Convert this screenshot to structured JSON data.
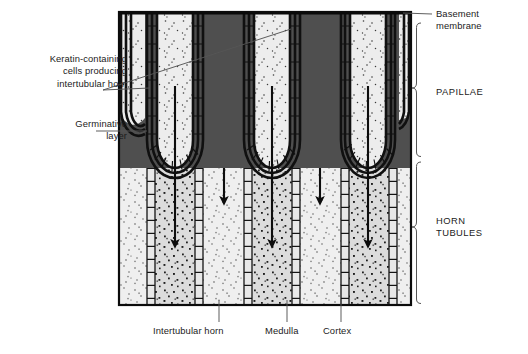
{
  "figure": {
    "title_alt": "Histological cross-section of horn: papillae and horn tubules",
    "frame": {
      "x": 119,
      "y": 12,
      "width": 292,
      "height": 293
    },
    "colors": {
      "background": "#ffffff",
      "outline": "#111111",
      "papilla_dark": "#4a4a4a",
      "germinative_layer": "#141414",
      "intertubular_horn": "#ececec",
      "medulla": "#d9d9d9",
      "cortex": "#e4e4e4",
      "leader_line": "#555555",
      "bracket": "#555555",
      "text": "#1b1b1b"
    }
  },
  "labels": {
    "keratin": {
      "text": "Keratin-containing\ncells producing\nintertubular horn",
      "x": 17,
      "y": 53
    },
    "germinative": {
      "text": "Germinative\nlayer",
      "x": 40,
      "y": 118
    },
    "basement": {
      "text": "Basement\nmembrane",
      "x": 436,
      "y": 8
    },
    "papillae": {
      "text": "PAPILLAE",
      "x": 436,
      "y": 86
    },
    "horn_tubules": {
      "text": "HORN\nTUBULES",
      "x": 436,
      "y": 215
    },
    "intertubular_horn": {
      "text": "Intertubular horn",
      "x": 153,
      "y": 329
    },
    "medulla": {
      "text": "Medulla",
      "x": 271,
      "y": 329
    },
    "cortex": {
      "text": "Cortex",
      "x": 325,
      "y": 329
    }
  },
  "brackets": [
    {
      "name": "papillae-bracket",
      "label": "PAPILLAE",
      "top": 22,
      "bottom": 158,
      "x": 420
    },
    {
      "name": "horn-tubules-bracket",
      "label": "HORN TUBULES",
      "top": 160,
      "bottom": 305,
      "x": 420
    }
  ],
  "structures": {
    "papillae": [
      {
        "center_x": 175,
        "tip_y": 168
      },
      {
        "center_x": 272,
        "tip_y": 168
      },
      {
        "center_x": 368,
        "tip_y": 168
      }
    ],
    "tubule_columns": [
      {
        "name": "intertubular-horn",
        "x": 119,
        "width": 28
      },
      {
        "name": "cortex",
        "x": 147,
        "width": 8
      },
      {
        "name": "medulla",
        "x": 155,
        "width": 40
      },
      {
        "name": "cortex",
        "x": 195,
        "width": 8
      },
      {
        "name": "intertubular-horn",
        "x": 203,
        "width": 41
      },
      {
        "name": "cortex",
        "x": 244,
        "width": 8
      },
      {
        "name": "medulla",
        "x": 252,
        "width": 40
      },
      {
        "name": "cortex",
        "x": 292,
        "width": 8
      },
      {
        "name": "intertubular-horn",
        "x": 300,
        "width": 41
      },
      {
        "name": "cortex",
        "x": 341,
        "width": 8
      },
      {
        "name": "medulla",
        "x": 349,
        "width": 40
      },
      {
        "name": "cortex",
        "x": 389,
        "width": 8
      },
      {
        "name": "intertubular-horn",
        "x": 397,
        "width": 14
      }
    ],
    "growth_arrows": [
      {
        "x": 175,
        "y_start": 86,
        "y_end": 248
      },
      {
        "x": 224,
        "y_start": 168,
        "y_end": 205
      },
      {
        "x": 272,
        "y_start": 86,
        "y_end": 248
      },
      {
        "x": 320,
        "y_start": 168,
        "y_end": 205
      },
      {
        "x": 368,
        "y_start": 86,
        "y_end": 248
      }
    ]
  },
  "leaders": {
    "keratin": [
      {
        "from_x": 103,
        "from_y": 90,
        "to_x": 150,
        "to_y": 88
      },
      {
        "from_x": 103,
        "from_y": 90,
        "to_x": 291,
        "to_y": 29
      }
    ],
    "germinative": [
      {
        "from_x": 96,
        "from_y": 131,
        "to_x": 147,
        "to_y": 131
      }
    ],
    "basement": [
      {
        "from_x": 432,
        "from_y": 14,
        "to_x": 403,
        "to_y": 13
      }
    ],
    "intertubular_horn": [
      {
        "from_x": 219,
        "from_y": 322,
        "to_x": 219,
        "to_y": 299
      }
    ],
    "medulla": [
      {
        "from_x": 287,
        "from_y": 322,
        "to_x": 287,
        "to_y": 299
      }
    ],
    "cortex": [
      {
        "from_x": 341,
        "from_y": 322,
        "to_x": 341,
        "to_y": 299
      }
    ]
  }
}
